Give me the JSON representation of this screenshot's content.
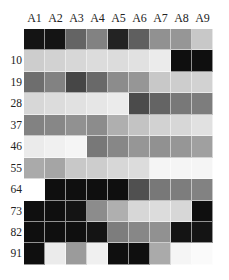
{
  "chart_data": {
    "type": "heatmap",
    "title": "",
    "xlabel": "",
    "ylabel": "",
    "columns": [
      "A1",
      "A2",
      "A3",
      "A4",
      "A5",
      "A6",
      "A7",
      "A8",
      "A9"
    ],
    "rows": [
      "",
      "10",
      "19",
      "28",
      "37",
      "46",
      "55",
      "64",
      "73",
      "82",
      "91"
    ],
    "value_scale": "grayscale 0 (black) to 255 (white)",
    "values": [
      [
        20,
        20,
        100,
        130,
        35,
        95,
        145,
        150,
        200
      ],
      [
        205,
        210,
        215,
        220,
        220,
        225,
        235,
        15,
        15
      ],
      [
        110,
        130,
        70,
        105,
        140,
        150,
        200,
        205,
        210
      ],
      [
        215,
        220,
        225,
        230,
        235,
        75,
        100,
        120,
        125
      ],
      [
        130,
        135,
        145,
        140,
        175,
        195,
        210,
        215,
        225
      ],
      [
        235,
        240,
        245,
        120,
        135,
        150,
        145,
        150,
        160
      ],
      [
        170,
        165,
        200,
        205,
        215,
        220,
        245,
        245,
        245
      ],
      [
        255,
        15,
        15,
        15,
        15,
        80,
        120,
        125,
        130
      ],
      [
        15,
        15,
        20,
        140,
        175,
        215,
        220,
        215,
        15
      ],
      [
        15,
        15,
        15,
        20,
        125,
        135,
        145,
        20,
        20
      ],
      [
        15,
        235,
        155,
        240,
        15,
        15,
        170,
        245,
        250
      ]
    ],
    "grid": false,
    "legend": "none"
  }
}
